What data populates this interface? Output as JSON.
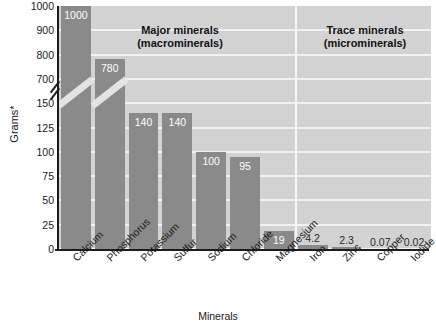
{
  "chart_data": {
    "type": "bar",
    "title": "",
    "xlabel": "Minerals",
    "ylabel": "Grams*",
    "grid": true,
    "legend_position": "none",
    "axis_break": {
      "present": true,
      "below": 150,
      "above": 700
    },
    "ytick_labels": [
      "1000",
      "900",
      "800",
      "700",
      "150",
      "125",
      "100",
      "75",
      "50",
      "25",
      "0"
    ],
    "categories": [
      "Calcium",
      "Phosphorus",
      "Potassium",
      "Sulfur",
      "Sodium",
      "Chloride",
      "Magnesium",
      "Iron",
      "Zinc",
      "Copper",
      "Iodide"
    ],
    "values": [
      1000,
      780,
      140,
      140,
      100,
      95,
      19,
      4.2,
      2.3,
      0.07,
      0.02
    ],
    "value_labels": [
      "1000",
      "780",
      "140",
      "140",
      "100",
      "95",
      "19",
      "4.2",
      "2.3",
      "0.07",
      "0.02"
    ],
    "annotations": [
      {
        "text": "Major minerals\n(macrominerals)",
        "group": "major"
      },
      {
        "text": "Trace minerals\n(microminerals)",
        "group": "trace"
      }
    ],
    "colors": {
      "bar": "#8a8a8a",
      "plot_background": "#d2d2d2",
      "gridline": "#f2f2f2",
      "axis": "#1c1c1c",
      "label_on_bar": "#ffffff",
      "label_off_bar": "#2b2b2b"
    }
  },
  "sections": {
    "major_line1": "Major minerals",
    "major_line2": "(macrominerals)",
    "trace_line1": "Trace minerals",
    "trace_line2": "(microminerals)"
  }
}
